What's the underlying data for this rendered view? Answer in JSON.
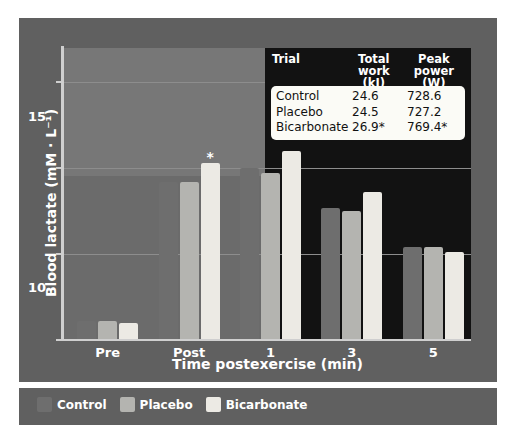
{
  "chart_data": {
    "type": "bar",
    "title": "",
    "xlabel": "Time postexercise (min)",
    "ylabel": "Blood lactate (mM · L⁻¹)",
    "categories": [
      "Pre",
      "Post",
      "1",
      "3",
      "5"
    ],
    "ylim": [
      0,
      17
    ],
    "yticks": [
      0,
      5,
      10,
      15
    ],
    "ytick_labels": [
      "0",
      "5",
      "10",
      "15"
    ],
    "grid": true,
    "legend_position": "bottom-left",
    "series": [
      {
        "name": "Control",
        "color": "#6e6e6e",
        "values": [
          1.1,
          9.2,
          10.0,
          7.7,
          5.4
        ],
        "significant": [
          false,
          false,
          false,
          false,
          false
        ]
      },
      {
        "name": "Placebo",
        "color": "#b4b4b0",
        "values": [
          1.1,
          9.2,
          9.7,
          7.5,
          5.4
        ],
        "significant": [
          false,
          false,
          false,
          false,
          false
        ]
      },
      {
        "name": "Bicarbonate",
        "color": "#eceae4",
        "values": [
          1.0,
          10.3,
          11.0,
          8.6,
          5.1
        ],
        "significant": [
          false,
          true,
          true,
          false,
          false
        ]
      }
    ],
    "annotations": [
      {
        "text": "*",
        "category": "Post",
        "series": "Bicarbonate"
      },
      {
        "text": "*",
        "category": "1",
        "series": "Bicarbonate"
      }
    ]
  },
  "inset_table": {
    "type": "table",
    "headers": [
      {
        "line1": "Trial",
        "line2": ""
      },
      {
        "line1": "Total work",
        "line2": "(kJ)"
      },
      {
        "line1": "Peak power",
        "line2": "(W)"
      }
    ],
    "rows": [
      {
        "trial": "Control",
        "total_work": "24.6",
        "peak_power": "728.6"
      },
      {
        "trial": "Placebo",
        "total_work": "24.5",
        "peak_power": "727.2"
      },
      {
        "trial": "Bicarbonate",
        "total_work": "26.9*",
        "peak_power": "769.4*"
      }
    ]
  },
  "legend": {
    "items": [
      {
        "label": "Control",
        "color": "#6e6e6e"
      },
      {
        "label": "Placebo",
        "color": "#b4b4b0"
      },
      {
        "label": "Bicarbonate",
        "color": "#eceae4"
      }
    ]
  },
  "colors": {
    "frame": "#606060",
    "plot_background_light": "#777777",
    "plot_background_mid": "#6b6b6b",
    "plot_background_dark": "#121212",
    "gridline": "#8d8d8d",
    "axis": "#cfcfcf",
    "text_light": "#ffffff",
    "text_dark": "#111111",
    "inset_body": "#fbfbf6"
  }
}
